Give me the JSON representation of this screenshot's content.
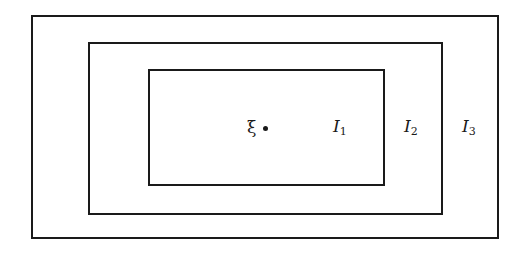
{
  "diagram": {
    "type": "nested-rectangles",
    "rectangles": [
      {
        "id": "I3",
        "label": "I",
        "subscript": "3",
        "role": "outer"
      },
      {
        "id": "I2",
        "label": "I",
        "subscript": "2",
        "role": "middle"
      },
      {
        "id": "I1",
        "label": "I",
        "subscript": "1",
        "role": "inner"
      }
    ],
    "point": {
      "label": "ξ",
      "marker": "•"
    }
  }
}
